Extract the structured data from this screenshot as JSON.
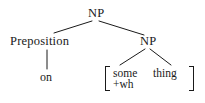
{
  "diagram": {
    "type": "syntax-tree",
    "title": "",
    "background_color": "#ffffff",
    "line_color": "#1a1a1a",
    "text_color": "#1a1a1a",
    "nodes": {
      "root_np": "NP",
      "preposition": "Preposition",
      "preposition_word": "on",
      "inner_np": "NP"
    },
    "feature_matrix": {
      "left_bracket": "[",
      "right_bracket": "]",
      "rows": [
        {
          "col_a": "some",
          "col_b": "thing"
        },
        {
          "col_a": "+wh",
          "col_b": ""
        }
      ],
      "features": [
        "some",
        "+wh"
      ],
      "sister": "thing"
    },
    "edges": [
      {
        "from": "root_np",
        "to": "preposition"
      },
      {
        "from": "root_np",
        "to": "inner_np"
      },
      {
        "from": "preposition",
        "to": "preposition_word"
      },
      {
        "from": "inner_np",
        "to": "feature_matrix_left"
      },
      {
        "from": "inner_np",
        "to": "feature_matrix_right"
      }
    ]
  }
}
